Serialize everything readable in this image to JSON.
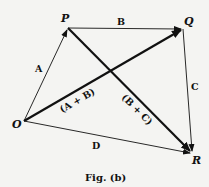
{
  "diagram": {
    "points": {
      "O": {
        "label": "O",
        "x": 24,
        "y": 121
      },
      "P": {
        "label": "P",
        "x": 68,
        "y": 28
      },
      "Q": {
        "label": "Q",
        "x": 183,
        "y": 29
      },
      "R": {
        "label": "R",
        "x": 192,
        "y": 153
      }
    },
    "vectors": [
      {
        "from": "O",
        "to": "P",
        "label": "A",
        "weight": "thin"
      },
      {
        "from": "P",
        "to": "Q",
        "label": "B",
        "weight": "thin"
      },
      {
        "from": "Q",
        "to": "R",
        "label": "C",
        "weight": "thin"
      },
      {
        "from": "O",
        "to": "R",
        "label": "D",
        "weight": "thin"
      },
      {
        "from": "O",
        "to": "Q",
        "label": "(A + B)",
        "weight": "thick"
      },
      {
        "from": "P",
        "to": "R",
        "label": "(B + C)",
        "weight": "thick"
      }
    ],
    "caption": "Fig. (b)"
  }
}
